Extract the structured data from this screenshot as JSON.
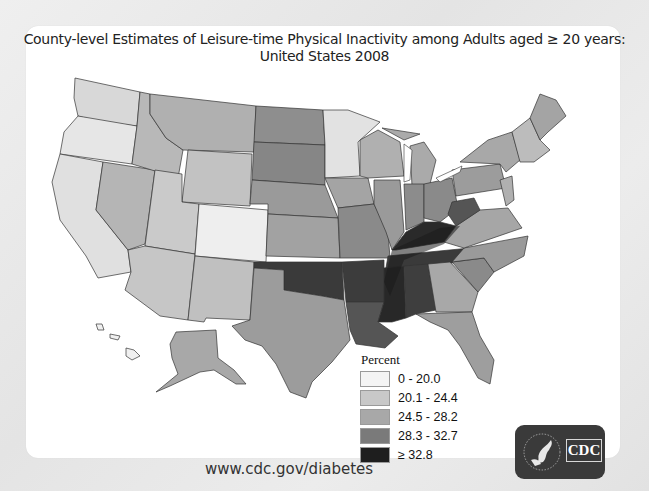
{
  "title": {
    "line1": "County-level Estimates of Leisure-time Physical Inactivity among Adults aged ≥ 20 years:",
    "line2": "United States 2008"
  },
  "legend": {
    "title": "Percent",
    "items": [
      {
        "label": "0 - 20.0",
        "color": "#f4f4f4"
      },
      {
        "label": "20.1 - 24.4",
        "color": "#c8c8c8"
      },
      {
        "label": "24.5 - 28.2",
        "color": "#a8a8a8"
      },
      {
        "label": "28.3 - 32.7",
        "color": "#7a7a7a"
      },
      {
        "label": "≥ 32.8",
        "color": "#1e1e1e"
      }
    ]
  },
  "footer": {
    "url": "www.cdc.gov/diabetes"
  },
  "logo": {
    "text": "CDC"
  }
}
